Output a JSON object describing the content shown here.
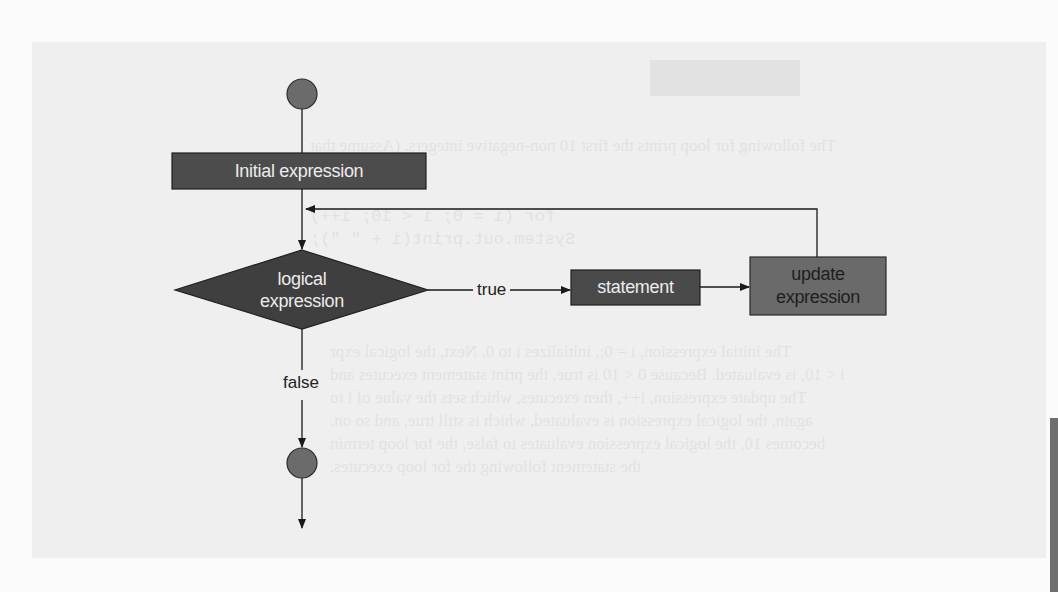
{
  "diagram": {
    "nodes": {
      "start": {
        "shape": "circle",
        "color": "#6b6b6b"
      },
      "initial": {
        "shape": "rectangle",
        "label": "Initial expression",
        "fill": "#4c4c4c",
        "text_color": "#ececec"
      },
      "condition": {
        "shape": "diamond",
        "label_line1": "logical",
        "label_line2": "expression",
        "fill": "#3f3f3f",
        "text_color": "#ececec"
      },
      "statement": {
        "shape": "rectangle",
        "label": "statement",
        "fill": "#4a4a4a",
        "text_color": "#ececec"
      },
      "update": {
        "shape": "rectangle",
        "label_line1": "update",
        "label_line2": "expression",
        "fill": "#6a6a6a",
        "text_color": "#1e1e1e"
      },
      "end": {
        "shape": "circle",
        "color": "#6b6b6b"
      }
    },
    "edges": [
      {
        "from": "start",
        "to": "initial",
        "label": ""
      },
      {
        "from": "initial",
        "to": "condition",
        "label": ""
      },
      {
        "from": "condition",
        "to": "statement",
        "label": "true"
      },
      {
        "from": "statement",
        "to": "update",
        "label": ""
      },
      {
        "from": "update",
        "to": "condition",
        "label": ""
      },
      {
        "from": "condition",
        "to": "end",
        "label": "false"
      },
      {
        "from": "end",
        "to": "exit",
        "label": ""
      }
    ],
    "edge_labels": {
      "true": "true",
      "false": "false"
    }
  },
  "show_through_text": {
    "line1": "The following for loop prints the first 10 non-negative integers. (Assume that",
    "line2": "variable)",
    "code1": "for (i = 0; i < 10; i++)",
    "code2": "    System.out.print(i + \" \");",
    "para1": "The initial expression, i = 0;, initializes i to 0. Next, the logical expr",
    "para2": "i < 10, is evaluated. Because 0 < 10 is true, the print statement executes and",
    "para3": "The update expression, i++, then executes, which sets the value of i to",
    "para4": "again, the logical expression is evaluated, which is still true, and so on.",
    "para5": "becomes 10, the logical expression evaluates to false, the for loop termin",
    "para6": "the statement following the for loop executes."
  }
}
